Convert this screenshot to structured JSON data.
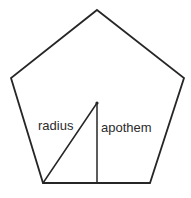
{
  "figure": {
    "background_color": "#ffffff",
    "stroke_color": "#262626",
    "text_color": "#2b2b2b",
    "stroke_width": 1.8,
    "canvas": {
      "width": 191,
      "height": 198
    },
    "shape": {
      "name": "regular-pentagon",
      "sides": 5,
      "fill": "#ffffff",
      "vertices": [
        {
          "name": "apex-top",
          "x": 97,
          "y": 10
        },
        {
          "name": "upper-right",
          "x": 184,
          "y": 78
        },
        {
          "name": "bottom-right",
          "x": 150,
          "y": 183
        },
        {
          "name": "bottom-left",
          "x": 43,
          "y": 183
        },
        {
          "name": "upper-left",
          "x": 11,
          "y": 78
        }
      ]
    },
    "center": {
      "name": "center-point",
      "x": 97,
      "y": 103
    },
    "segments": [
      {
        "name": "radius-segment",
        "label": "radius",
        "from": {
          "x": 97,
          "y": 103
        },
        "to": {
          "x": 43,
          "y": 183
        }
      },
      {
        "name": "apothem-segment",
        "label": "apothem",
        "from": {
          "x": 97,
          "y": 103
        },
        "to": {
          "x": 97,
          "y": 183
        }
      }
    ],
    "labels": {
      "radius": "radius",
      "apothem": "apothem"
    }
  }
}
